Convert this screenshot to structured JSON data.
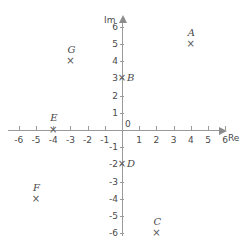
{
  "chart_data": {
    "type": "scatter",
    "title": "",
    "xlabel": "Re",
    "ylabel": "Im",
    "xlim": [
      -6.5,
      6.5
    ],
    "ylim": [
      -6.5,
      6.5
    ],
    "grid": false,
    "x_ticks": [
      "-6",
      "-5",
      "-4",
      "-3",
      "-2",
      "-1",
      "0",
      "1",
      "2",
      "3",
      "4",
      "5",
      "6"
    ],
    "y_ticks": [
      "6",
      "5",
      "4",
      "3",
      "2",
      "1",
      "-1",
      "-2",
      "-3",
      "-4",
      "-5",
      "-6"
    ],
    "origin_label": "0",
    "marker": "x",
    "points": [
      {
        "label": "A",
        "x": 4,
        "y": 5,
        "marker": "×"
      },
      {
        "label": "B",
        "x": 0,
        "y": 3,
        "marker": "×"
      },
      {
        "label": "C",
        "x": 2,
        "y": -6,
        "marker": "×"
      },
      {
        "label": "D",
        "x": 0,
        "y": -2,
        "marker": "×"
      },
      {
        "label": "E",
        "x": -4,
        "y": 0,
        "marker": "×"
      },
      {
        "label": "F",
        "x": -5,
        "y": -4,
        "marker": "×"
      },
      {
        "label": "G",
        "x": -3,
        "y": 4,
        "marker": "×"
      }
    ]
  },
  "axes": {
    "real_axis_name": "Re",
    "imaginary_axis_name": "Im"
  },
  "colors": {
    "axis": "#9a9a9a",
    "text": "#4a4a4a",
    "marker": "#585858",
    "background": "#ffffff"
  }
}
